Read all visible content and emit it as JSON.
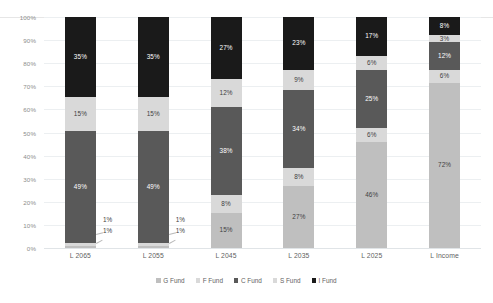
{
  "chart_data": {
    "type": "bar",
    "stacked": true,
    "stack_mode": "percent",
    "title": "",
    "subtitle": "",
    "xlabel": "",
    "ylabel": "",
    "ylim": [
      0,
      100
    ],
    "grid": true,
    "legend_position": "bottom",
    "categories": [
      "L 2065",
      "L 2055",
      "L 2045",
      "L 2035",
      "L 2025",
      "L Income"
    ],
    "ytick_labels": [
      "0%",
      "10%",
      "20%",
      "30%",
      "40%",
      "50%",
      "60%",
      "70%",
      "80%",
      "90%",
      "100%"
    ],
    "ytick_values": [
      0,
      10,
      20,
      30,
      40,
      50,
      60,
      70,
      80,
      90,
      100
    ],
    "series": [
      {
        "name": "G Fund",
        "color": "#bfbfbf",
        "label_color": "light",
        "values": [
          1,
          1,
          15,
          27,
          46,
          72
        ],
        "labels": [
          "1%",
          "1%",
          "15%",
          "27%",
          "46%",
          "72%"
        ],
        "callout": [
          true,
          true,
          false,
          false,
          false,
          false
        ]
      },
      {
        "name": "F Fund",
        "color": "#d9d9d9",
        "label_color": "light",
        "values": [
          1,
          1,
          8,
          8,
          6,
          6
        ],
        "labels": [
          "1%",
          "1%",
          "8%",
          "8%",
          "6%",
          "6%"
        ],
        "callout": [
          true,
          true,
          false,
          false,
          false,
          false
        ]
      },
      {
        "name": "C Fund",
        "color": "#595959",
        "label_color": "dark",
        "values": [
          49,
          49,
          38,
          34,
          25,
          12
        ],
        "labels": [
          "49%",
          "49%",
          "38%",
          "34%",
          "25%",
          "12%"
        ],
        "callout": [
          false,
          false,
          false,
          false,
          false,
          false
        ]
      },
      {
        "name": "S Fund",
        "color": "#d9d9d9",
        "label_color": "light",
        "values": [
          15,
          15,
          12,
          9,
          6,
          3
        ],
        "labels": [
          "15%",
          "15%",
          "12%",
          "9%",
          "6%",
          "3%"
        ],
        "callout": [
          false,
          false,
          false,
          false,
          false,
          false
        ]
      },
      {
        "name": "I Fund",
        "color": "#1a1a1a",
        "label_color": "dark",
        "values": [
          35,
          35,
          27,
          23,
          17,
          8
        ],
        "labels": [
          "35%",
          "35%",
          "27%",
          "23%",
          "17%",
          "8%"
        ],
        "callout": [
          false,
          false,
          false,
          false,
          false,
          false
        ]
      }
    ]
  }
}
